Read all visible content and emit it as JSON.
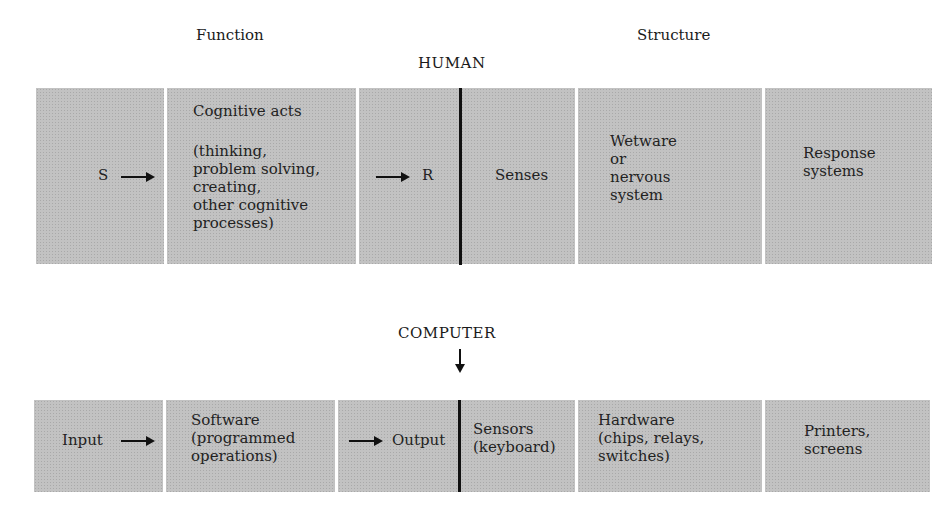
{
  "headers": {
    "function": "Function",
    "structure": "Structure"
  },
  "human": {
    "title": "HUMAN",
    "cells": [
      {
        "id": "stimulus",
        "text": "S"
      },
      {
        "id": "cognitive-acts",
        "title": "Cognitive acts",
        "text": "(thinking,\nproblem solving,\ncreating,\nother cognitive\nprocesses)"
      },
      {
        "id": "response",
        "text": "R"
      },
      {
        "id": "senses",
        "text": "Senses"
      },
      {
        "id": "wetware",
        "text": "Wetware\nor\nnervous\nsystem"
      },
      {
        "id": "response-systems",
        "text": "Response\nsystems"
      }
    ]
  },
  "computer": {
    "title": "COMPUTER",
    "cells": [
      {
        "id": "input",
        "text": "Input"
      },
      {
        "id": "software",
        "text": "Software\n(programmed\noperations)"
      },
      {
        "id": "output",
        "text": "Output"
      },
      {
        "id": "sensors",
        "text": "Sensors\n(keyboard)"
      },
      {
        "id": "hardware",
        "text": "Hardware\n(chips, relays,\nswitches)"
      },
      {
        "id": "printers",
        "text": "Printers,\nscreens"
      }
    ]
  },
  "colors": {
    "cell_fill": "#c2c2c2",
    "line": "#111111",
    "text": "#1a1a1a"
  }
}
